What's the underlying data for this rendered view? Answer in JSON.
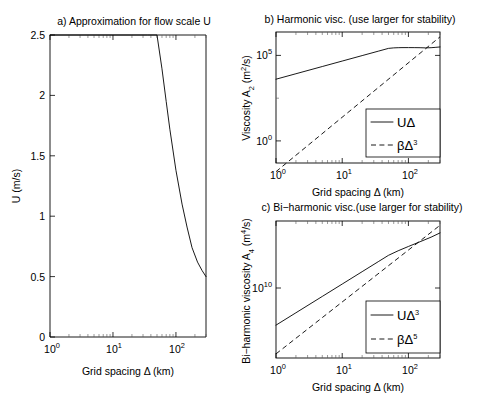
{
  "figure": {
    "background": "#ffffff",
    "line_color": "#000000"
  },
  "chart_data": [
    {
      "id": "panel_a",
      "type": "line",
      "title": "a) Approximation for flow scale U",
      "xlabel": "Grid spacing Δ (km)",
      "ylabel": "U (m/s)",
      "xscale": "log",
      "yscale": "linear",
      "xlim": [
        1,
        300
      ],
      "ylim": [
        0,
        2.5
      ],
      "xticks": [
        1,
        10,
        100
      ],
      "xtick_labels": [
        "10^0",
        "10^1",
        "10^2"
      ],
      "yticks": [
        0,
        0.5,
        1,
        1.5,
        2,
        2.5
      ],
      "ytick_labels": [
        "0",
        "0.5",
        "1",
        "1.5",
        "2",
        "2.5"
      ],
      "grid": false,
      "legend": "none",
      "series": [
        {
          "name": "U",
          "style": "solid",
          "x": [
            1,
            2,
            5,
            10,
            20,
            35,
            50,
            60,
            70,
            80,
            100,
            125,
            150,
            180,
            220,
            260,
            300
          ],
          "y": [
            2.5,
            2.5,
            2.5,
            2.5,
            2.5,
            2.5,
            2.5,
            2.22,
            1.95,
            1.72,
            1.38,
            1.1,
            0.91,
            0.74,
            0.62,
            0.55,
            0.5
          ]
        }
      ]
    },
    {
      "id": "panel_b",
      "type": "line",
      "title": "b) Harmonic visc. (use larger for stability)",
      "xlabel": "Grid spacing Δ (km)",
      "ylabel": "Viscosity A_2 (m^2/s)",
      "ylabel_base": "Viscosity A",
      "ylabel_sub": "2",
      "ylabel_unit_open": "  (m",
      "ylabel_unit_sup": "2",
      "ylabel_unit_close": "/s)",
      "xscale": "log",
      "yscale": "log",
      "xlim": [
        1,
        300
      ],
      "ylim": [
        0.06,
        1000000
      ],
      "xticks": [
        1,
        10,
        100
      ],
      "xtick_labels": [
        "10^0",
        "10^1",
        "10^2"
      ],
      "yticks": [
        1,
        100000
      ],
      "ytick_labels": [
        "10^0",
        "10^5"
      ],
      "grid": false,
      "legend_position": "lower right",
      "series": [
        {
          "name": "UΔ",
          "style": "solid",
          "x": [
            1,
            2,
            5,
            10,
            20,
            35,
            50,
            60,
            70,
            80,
            100,
            125,
            150,
            180,
            220,
            260,
            300
          ],
          "y": [
            2500,
            5000,
            12500,
            25000,
            50000,
            87500,
            125000,
            133200,
            136500,
            137600,
            138000,
            137500,
            136500,
            133200,
            136400,
            143000,
            150000
          ]
        },
        {
          "name": "βΔ^3",
          "style": "dashed",
          "x": [
            1,
            300
          ],
          "y": [
            0.02,
            540000
          ]
        }
      ]
    },
    {
      "id": "panel_c",
      "type": "line",
      "title": "c) Bi−harmonic visc.(use larger for stability)",
      "xlabel": "Grid spacing Δ (km)",
      "ylabel": "Bi-harmonic viscosity A_4 (m^4/s)",
      "ylabel_base": "Bi−harmonic viscosity A",
      "ylabel_sub": "4",
      "ylabel_unit_open": "  (m",
      "ylabel_unit_sup": "4",
      "ylabel_unit_close": "/s)",
      "xscale": "log",
      "yscale": "log",
      "xlim": [
        1,
        300
      ],
      "ylim": [
        10000000,
        100000000000000000
      ],
      "xticks": [
        1,
        10,
        100
      ],
      "xtick_labels": [
        "10^0",
        "10^1",
        "10^2"
      ],
      "yticks": [
        10000000000
      ],
      "ytick_labels": [
        "10^10"
      ],
      "grid": false,
      "legend_position": "lower right",
      "series": [
        {
          "name": "UΔ^3",
          "style": "solid",
          "x": [
            1,
            2,
            5,
            10,
            20,
            35,
            50,
            70,
            100,
            150,
            220,
            300
          ],
          "y": [
            2500000000,
            20000000000,
            312000000000,
            2500000000000,
            20000000000000,
            107000000000000,
            312000000000000,
            670000000000000,
            1380000000000000,
            3070000000000000,
            6600000000000000,
            13500000000000000
          ]
        },
        {
          "name": "βΔ^5",
          "style": "dashed",
          "x": [
            1,
            300
          ],
          "y": [
            20000000,
            48600000000000000
          ]
        }
      ]
    }
  ],
  "legends": {
    "panel_b": [
      {
        "label_base": "UΔ",
        "label_sup": "",
        "style": "solid"
      },
      {
        "label_base": "βΔ",
        "label_sup": "3",
        "style": "dashed"
      }
    ],
    "panel_c": [
      {
        "label_base": "UΔ",
        "label_sup": "3",
        "style": "solid"
      },
      {
        "label_base": "βΔ",
        "label_sup": "5",
        "style": "dashed"
      }
    ]
  },
  "tick_marks": {
    "exp_zero": "0",
    "exp_one": "1",
    "exp_two": "2",
    "exp_five": "5",
    "exp_ten": "10",
    "base_ten": "10"
  }
}
